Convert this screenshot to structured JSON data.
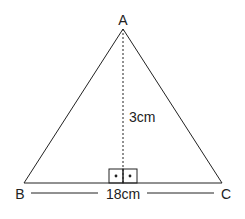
{
  "diagram": {
    "type": "isosceles-triangle",
    "vertices": {
      "A": {
        "label": "A"
      },
      "B": {
        "label": "B"
      },
      "C": {
        "label": "C"
      }
    },
    "height_label": "3cm",
    "base_label": "18cm",
    "right_angle_markers": 2,
    "stroke_color": "#222222",
    "background": "#ffffff"
  }
}
